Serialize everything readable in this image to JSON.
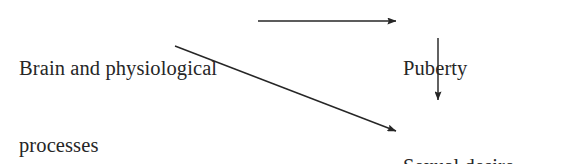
{
  "diagram": {
    "background_color": "#ffffff",
    "stroke_color": "#262626",
    "text_color": "#262626",
    "nodes": [
      {
        "id": "brain",
        "name": "brain-and-physiological-processes",
        "lines": [
          "Brain and physiological",
          "processes"
        ],
        "x": 19,
        "y": 5
      },
      {
        "id": "puberty",
        "name": "puberty",
        "lines": [
          "Puberty"
        ],
        "x": 403,
        "y": 5
      },
      {
        "id": "sexual",
        "name": "sexual-desire-and-behaviors",
        "lines": [
          "Sexual desire",
          "and behaviors"
        ],
        "x": 403,
        "y": 103
      }
    ],
    "arrows": [
      {
        "id": "brain-to-puberty",
        "name": "arrow-brain-to-puberty",
        "from": "brain",
        "to": "puberty",
        "orientation": "horizontal",
        "x1": 258,
        "y1": 21,
        "x2": 396,
        "y2": 21
      },
      {
        "id": "puberty-to-sexual",
        "name": "arrow-puberty-to-sexual",
        "from": "puberty",
        "to": "sexual",
        "orientation": "vertical",
        "x1": 438,
        "y1": 38,
        "x2": 438,
        "y2": 100
      },
      {
        "id": "brain-to-sexual",
        "name": "arrow-brain-to-sexual",
        "from": "brain",
        "to": "sexual",
        "orientation": "diagonal",
        "x1": 175,
        "y1": 46,
        "x2": 396,
        "y2": 131
      }
    ]
  }
}
